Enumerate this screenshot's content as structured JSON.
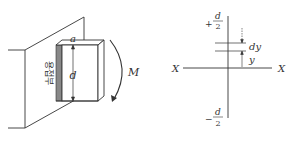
{
  "left_figure": {
    "weld_label": "용접부",
    "width_label": "a",
    "depth_label": "d",
    "moment_label": "M"
  },
  "right_figure": {
    "top_label_sign": "+",
    "top_label_num": "d",
    "top_label_den": "2",
    "bottom_label_sign": "−",
    "bottom_label_num": "d",
    "bottom_label_den": "2",
    "axis_left": "X",
    "axis_right": "X",
    "strip_label": "dy",
    "distance_label": "y"
  },
  "colors": {
    "line": "#333333",
    "weld_fill": "#888888"
  }
}
